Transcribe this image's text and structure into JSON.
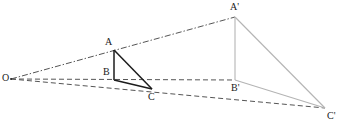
{
  "figure": {
    "kind": "geometry-diagram",
    "width": 341,
    "height": 126,
    "background_color": "#ffffff"
  },
  "colors": {
    "source_triangle_stroke": "#1c1c1c",
    "image_triangle_stroke": "#b4b4b4",
    "ray_stroke": "#555555",
    "label_color": "#1a1a1a"
  },
  "points": [
    {
      "id": "O",
      "label": "O",
      "x": 11,
      "y": 79,
      "label_x": 5,
      "label_y": 73
    },
    {
      "id": "A",
      "label": "A",
      "x": 114,
      "y": 50,
      "label_x": 106,
      "label_y": 38
    },
    {
      "id": "B",
      "label": "B",
      "x": 114,
      "y": 80,
      "label_x": 104,
      "label_y": 68
    },
    {
      "id": "C",
      "label": "C",
      "x": 152,
      "y": 89,
      "label_x": 148,
      "label_y": 93
    },
    {
      "id": "Ap",
      "label": "A'",
      "x": 235,
      "y": 17,
      "label_x": 230,
      "label_y": 3
    },
    {
      "id": "Bp",
      "label": "B'",
      "x": 235,
      "y": 80,
      "label_x": 231,
      "label_y": 84
    },
    {
      "id": "Cp",
      "label": "C'",
      "x": 325,
      "y": 108,
      "label_x": 327,
      "label_y": 111
    }
  ],
  "rays": [
    {
      "id": "ray-OA-Ap",
      "from": "O",
      "through": "A",
      "to": "Ap",
      "style": "dash-dot"
    },
    {
      "id": "ray-OB-Bp",
      "from": "O",
      "through": "B",
      "to": "Bp",
      "style": "dashed"
    },
    {
      "id": "ray-OC-Cp",
      "from": "O",
      "through": "C",
      "to": "Cp",
      "style": "dashed"
    }
  ],
  "triangles": [
    {
      "id": "triangle-ABC",
      "label": "ABC",
      "vertices": [
        "A",
        "B",
        "C"
      ],
      "stroke": "#1c1c1c",
      "stroke_width": 1.5,
      "style": "solid"
    },
    {
      "id": "triangle-ApBpCp",
      "label": "A'B'C'",
      "vertices": [
        "Ap",
        "Bp",
        "Cp"
      ],
      "stroke": "#b4b4b4",
      "stroke_width": 1.1,
      "style": "solid"
    }
  ]
}
